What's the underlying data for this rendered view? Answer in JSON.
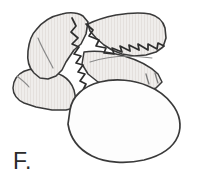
{
  "figure": {
    "panel_label": "F.",
    "label_color": "#2b2b2b",
    "background_color": "#ffffff",
    "outline_color": "#3a3a3a",
    "detail_line_color": "#6e6e6e",
    "shaded_fill_color": "#eeecea",
    "hatch_stripe_color": "#e2dedb",
    "white_fill_color": "#fdfdfd",
    "caption": "",
    "parts": [
      {
        "name": "upper-left-lobe",
        "fill": "#eeecea",
        "description": "shaded irregular flap, upper left"
      },
      {
        "name": "lower-left-lobe",
        "fill": "#eeecea",
        "description": "shaded rounded lobe, lower left"
      },
      {
        "name": "upper-right-lobe",
        "fill": "#eeecea",
        "description": "shaded elongated flap, upper right"
      },
      {
        "name": "jagged-suture-line",
        "stroke": "#2e2e2e",
        "description": "zig-zag interlocking suture between lobes"
      },
      {
        "name": "lower-mass",
        "fill": "#fdfdfd",
        "description": "large white kidney-shaped body, bottom center"
      },
      {
        "name": "hatch-marks",
        "stroke": "#7b7b7b",
        "description": "two short tick marks on right lobe"
      },
      {
        "name": "crease-line-left",
        "stroke": "#7b7b7b",
        "description": "curved crease inside upper-left lobe"
      },
      {
        "name": "crease-line-center",
        "stroke": "#7b7b7b",
        "description": "long thin arc beneath the suture"
      },
      {
        "name": "crease-line-lower-left",
        "stroke": "#7b7b7b",
        "description": "short arc on lower-left lobe edge"
      }
    ]
  }
}
